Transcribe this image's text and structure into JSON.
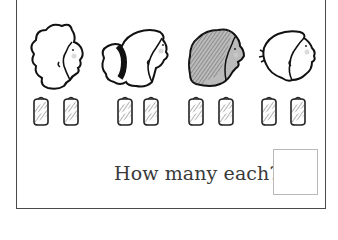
{
  "worksheet": {
    "question": "How many each?",
    "answer_value": "",
    "children": [
      {
        "name": "child-1",
        "hair": "curly-outline"
      },
      {
        "name": "child-2",
        "hair": "ponytail"
      },
      {
        "name": "child-3",
        "hair": "dark-shaded"
      },
      {
        "name": "child-4",
        "hair": "short-outline"
      }
    ],
    "cans_per_group": [
      2,
      2,
      2,
      2
    ],
    "total_cans": 8
  }
}
